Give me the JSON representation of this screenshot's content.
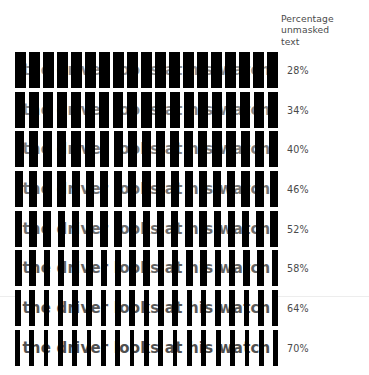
{
  "figure": {
    "background_color": "#ffffff",
    "bar_color": "#000000",
    "text_color": "#3c3c3c",
    "label_color": "#4a4a4a",
    "sentence": "the driver looks at his watch"
  },
  "column_header": {
    "line1": "Percentage",
    "line2": "unmasked",
    "line3": "text"
  },
  "chart_data": {
    "type": "bar",
    "title": "",
    "subtitle": "",
    "xlabel": "",
    "ylabel": "",
    "legend": "Percentage unmasked text",
    "grid": false,
    "categories": [
      "28%",
      "34%",
      "40%",
      "46%",
      "52%",
      "58%",
      "64%",
      "70%"
    ],
    "values": [
      28,
      34,
      40,
      46,
      52,
      58,
      64,
      70
    ],
    "series": [
      {
        "name": "percentage unmasked text",
        "values": [
          28,
          34,
          40,
          46,
          52,
          58,
          64,
          70
        ]
      }
    ],
    "annotations": [
      "the driver looks at his watch"
    ]
  },
  "rows": [
    {
      "percent_label": "28%",
      "percent_value": 28,
      "sentence": "the driver looks at his watch",
      "top": 52,
      "bar_count": 19,
      "bar_width": 11.1,
      "text_opacity": 0.55
    },
    {
      "percent_label": "34%",
      "percent_value": 34,
      "sentence": "the driver looks at his watch",
      "top": 92,
      "bar_count": 19,
      "bar_width": 10.1,
      "text_opacity": 0.6
    },
    {
      "percent_label": "40%",
      "percent_value": 40,
      "sentence": "the driver looks at his watch",
      "top": 131,
      "bar_count": 19,
      "bar_width": 9.2,
      "text_opacity": 0.65
    },
    {
      "percent_label": "46%",
      "percent_value": 46,
      "sentence": "the driver looks at his watch",
      "top": 171,
      "bar_count": 19,
      "bar_width": 8.3,
      "text_opacity": 0.7
    },
    {
      "percent_label": "52%",
      "percent_value": 52,
      "sentence": "the driver looks at his watch",
      "top": 211,
      "bar_count": 19,
      "bar_width": 7.4,
      "text_opacity": 0.75
    },
    {
      "percent_label": "58%",
      "percent_value": 58,
      "sentence": "the driver looks at his watch",
      "top": 250,
      "bar_count": 19,
      "bar_width": 6.5,
      "text_opacity": 0.8
    },
    {
      "percent_label": "64%",
      "percent_value": 64,
      "sentence": "the driver looks at his watch",
      "top": 290,
      "bar_count": 19,
      "bar_width": 5.6,
      "text_opacity": 0.85
    },
    {
      "percent_label": "70%",
      "percent_value": 70,
      "sentence": "the driver looks at his watch",
      "top": 330,
      "bar_count": 19,
      "bar_width": 4.7,
      "text_opacity": 0.9
    }
  ],
  "hairlines": [
    {
      "top": 296
    }
  ]
}
